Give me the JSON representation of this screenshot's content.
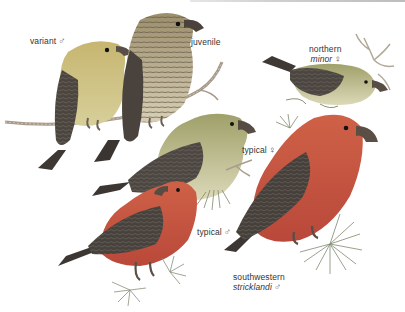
{
  "plate": {
    "subject": "Red Crossbill variants",
    "labels": [
      {
        "id": "variant-male",
        "line1": "variant",
        "line1_italic": false,
        "line2": "",
        "line2_italic": false,
        "sex": "♂",
        "x": 30,
        "y": 36
      },
      {
        "id": "juvenile",
        "line1": "juvenile",
        "line1_italic": false,
        "line2": "",
        "line2_italic": false,
        "sex": "",
        "x": 191,
        "y": 37
      },
      {
        "id": "northern-minor-female",
        "line1": "northern",
        "line1_italic": false,
        "line2": "minor",
        "line2_italic": true,
        "sex": "♀",
        "x": 309,
        "y": 44
      },
      {
        "id": "typical-female",
        "line1": "typical",
        "line1_italic": false,
        "line2": "",
        "line2_italic": false,
        "sex": "♀",
        "x": 242,
        "y": 145
      },
      {
        "id": "typical-male",
        "line1": "typical",
        "line1_italic": false,
        "line2": "",
        "line2_italic": false,
        "sex": "♂",
        "x": 197,
        "y": 227
      },
      {
        "id": "southwestern-stricklandi-male",
        "line1": "southwestern",
        "line1_italic": false,
        "line2": "stricklandi",
        "line2_italic": true,
        "sex": "♂",
        "x": 233,
        "y": 272
      }
    ],
    "colors": {
      "background": "#ffffff",
      "male_red": "#c9503a",
      "male_red_light": "#d9745c",
      "southwestern_red": "#c4553e",
      "female_olive": "#a8a86a",
      "female_yellow": "#c8c48a",
      "variant_yellow": "#c9b96a",
      "juvenile_streak": "#8a7e62",
      "wing_dark": "#3f3a36",
      "branch": "#a99a86",
      "pine_green": "#7e8a6e"
    }
  }
}
